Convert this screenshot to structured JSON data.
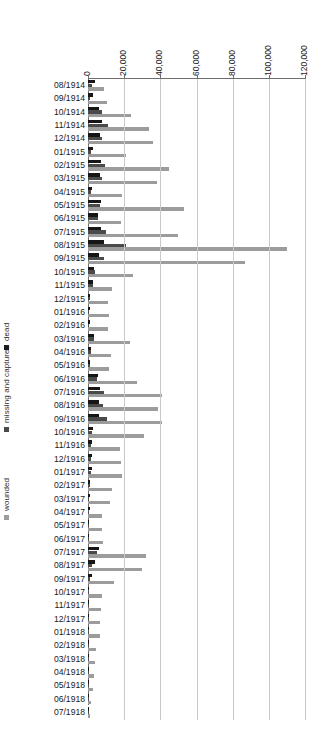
{
  "chart_data": {
    "type": "bar",
    "orientation": "horizontal",
    "title": "",
    "subtitle": "",
    "xlabel": "",
    "ylabel": "",
    "xlim": [
      0,
      120000
    ],
    "grid": true,
    "legend_position": "left",
    "xticks": [
      0,
      20000,
      40000,
      60000,
      80000,
      100000,
      120000
    ],
    "xtick_labels": [
      "0",
      "20,000",
      "40,000",
      "60,000",
      "80,000",
      "100,000",
      "120,000"
    ],
    "categories": [
      "08/1914",
      "09/1914",
      "10/1914",
      "11/1914",
      "12/1914",
      "01/1915",
      "02/1915",
      "03/1915",
      "04/1915",
      "05/1915",
      "06/1915",
      "07/1915",
      "08/1915",
      "09/1915",
      "10/1915",
      "11/1915",
      "12/1915",
      "01/1916",
      "02/1916",
      "03/1916",
      "04/1916",
      "05/1916",
      "06/1916",
      "07/1916",
      "08/1916",
      "09/1916",
      "10/1916",
      "11/1916",
      "12/1916",
      "01/1917",
      "02/1917",
      "03/1917",
      "04/1917",
      "05/1917",
      "06/1917",
      "07/1917",
      "08/1917",
      "09/1917",
      "10/1917",
      "11/1917",
      "12/1917",
      "01/1918",
      "02/1918",
      "03/1918",
      "04/1918",
      "05/1918",
      "06/1918",
      "07/1918"
    ],
    "series": [
      {
        "name": "dead",
        "color": "#161616",
        "values": [
          3800,
          2600,
          6200,
          7600,
          6400,
          2600,
          7000,
          6400,
          2200,
          7300,
          5300,
          7200,
          8600,
          6200,
          3300,
          2600,
          1100,
          1000,
          1000,
          3400,
          1700,
          1100,
          5400,
          6600,
          5900,
          6200,
          2800,
          2000,
          2200,
          2400,
          1300,
          1200,
          900,
          800,
          800,
          6200,
          3900,
          2200,
          800,
          600,
          500,
          500,
          400,
          400,
          300,
          300,
          250,
          250
        ]
      },
      {
        "name": "missing and captured",
        "color": "#4a4a4a",
        "values": [
          2100,
          1200,
          7800,
          11000,
          7900,
          1800,
          9300,
          7700,
          1500,
          6900,
          5400,
          9900,
          21000,
          8900,
          4000,
          2600,
          900,
          800,
          800,
          3100,
          1500,
          900,
          5200,
          8800,
          8500,
          10300,
          2400,
          1700,
          1800,
          1700,
          900,
          800,
          600,
          500,
          500,
          4900,
          2200,
          1200,
          500,
          400,
          300,
          300,
          250,
          250,
          200,
          200,
          150,
          150
        ]
      },
      {
        "name": "wounded",
        "color": "#9c9c9c",
        "values": [
          9000,
          10400,
          24000,
          34000,
          36000,
          21000,
          45000,
          38000,
          19000,
          53000,
          18000,
          50000,
          110000,
          87000,
          25000,
          13000,
          11000,
          11500,
          11000,
          23500,
          12500,
          11500,
          27000,
          41000,
          38500,
          41000,
          31000,
          17500,
          18000,
          19000,
          13000,
          12000,
          7500,
          8000,
          8500,
          32000,
          30000,
          14500,
          7500,
          7000,
          6500,
          6500,
          4500,
          4000,
          3500,
          3000,
          1800,
          1200
        ]
      }
    ]
  },
  "legend": {
    "items": [
      {
        "label": "dead",
        "color": "#161616"
      },
      {
        "label": "missing and captured",
        "color": "#4a4a4a"
      },
      {
        "label": "wounded",
        "color": "#9c9c9c"
      }
    ]
  }
}
